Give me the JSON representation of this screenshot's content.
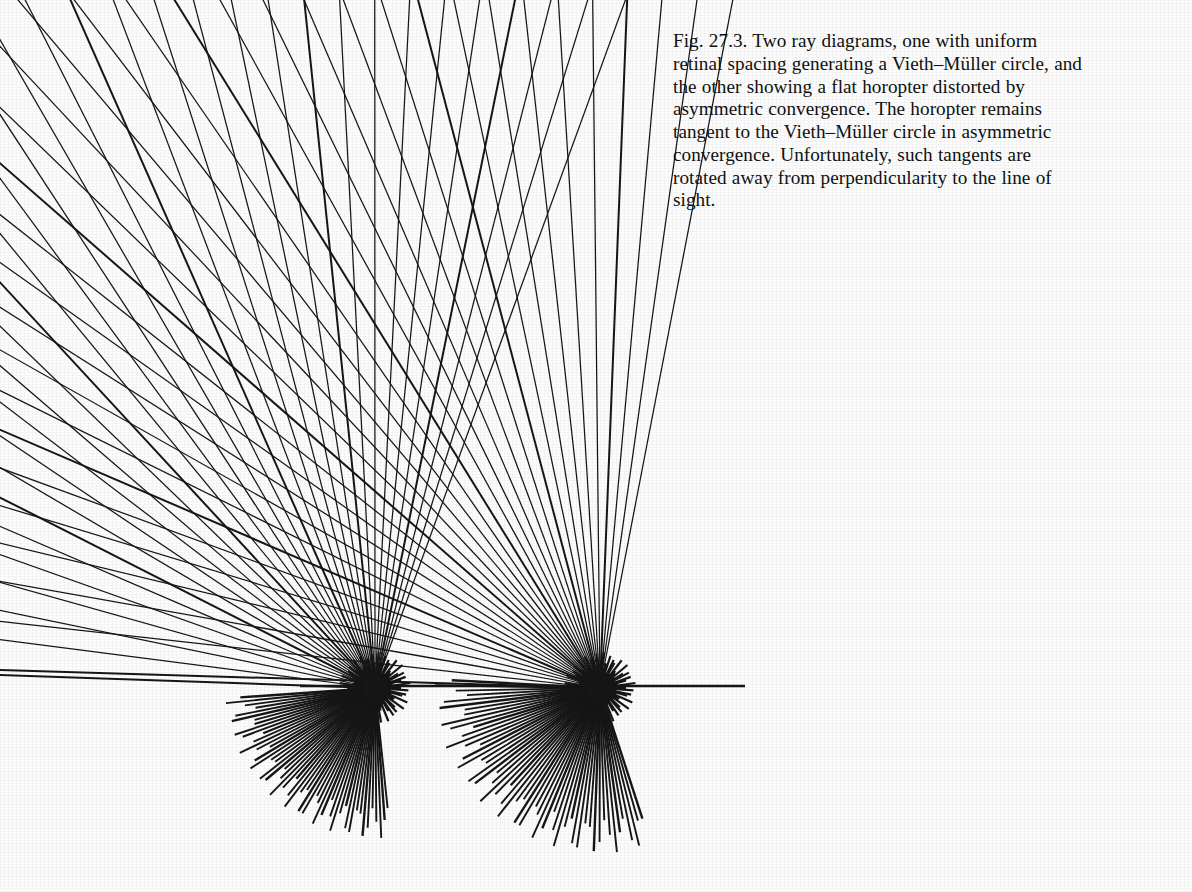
{
  "figure": {
    "label": "Fig. 27.3.",
    "caption_lines": [
      "Fig. 27.3. Two ray diagrams, one with uniform",
      "retinal spacing generating a Vieth–Müller circle, and",
      "the other showing a flat horopter distorted by",
      "asymmetric convergence. The horopter remains",
      "tangent to the Vieth–Müller circle in asymmetric",
      "convergence. Unfortunately, such tangents are",
      "rotated away from perpendicularity to the line of",
      "sight."
    ],
    "caption_full": "Fig. 27.3. Two ray diagrams, one with uniform retinal spacing generating a Vieth–Müller circle, and the other showing a flat horopter distorted by asymmetric convergence. The horopter remains tangent to the Vieth–Müller circle in asymmetric convergence. Unfortunately, such tangents are rotated away from perpendicularity to the line of sight."
  },
  "colors": {
    "background": "#fdfdfd",
    "ink": "#161616",
    "caption_text": "#101010"
  },
  "chart_data": {
    "type": "diagram",
    "canvas": {
      "width": 800,
      "height": 892
    },
    "nodes": [
      {
        "name": "left-eye-node",
        "x": 375,
        "y": 688
      },
      {
        "name": "right-eye-node",
        "x": 600,
        "y": 688
      }
    ],
    "interocular_line": {
      "x1": 300,
      "y1": 686,
      "x2": 745,
      "y2": 686
    },
    "upper_fan": {
      "ray_count": 34,
      "left_angle_start_deg": 182,
      "left_angle_end_deg": 290,
      "right_angle_start_deg": 250,
      "right_angle_end_deg": 358,
      "description": "Two pencils of rays from the two nodal points; corresponding pairs intersect at apexes tracing the horopter locus."
    },
    "apex_locus": {
      "description": "Intersection points of corresponding ray pairs; upper-left apexes run far off toward the top-left corner, the rest curve around into an arc",
      "sample_points": [
        [
          45,
          35
        ],
        [
          165,
          72
        ],
        [
          255,
          110
        ],
        [
          330,
          150
        ],
        [
          382,
          195
        ],
        [
          430,
          240
        ],
        [
          470,
          285
        ],
        [
          510,
          330
        ],
        [
          560,
          375
        ],
        [
          615,
          415
        ],
        [
          665,
          455
        ],
        [
          710,
          500
        ],
        [
          745,
          545
        ],
        [
          760,
          590
        ],
        [
          758,
          635
        ]
      ]
    },
    "retinal_fans": [
      {
        "name": "left-retinal-fan",
        "center_x": 375,
        "center_y": 688,
        "radius": 150,
        "spoke_count": 52,
        "angle_start_deg": 176,
        "angle_end_deg": 84
      },
      {
        "name": "right-retinal-fan",
        "center_x": 600,
        "center_y": 688,
        "radius": 165,
        "spoke_count": 56,
        "angle_start_deg": 183,
        "angle_end_deg": 72
      }
    ],
    "long_rays": {
      "description": "Three long ray pairs escaping to the upper-left, apexes at (45,35), (165,72), (255,110)",
      "count": 3
    }
  }
}
